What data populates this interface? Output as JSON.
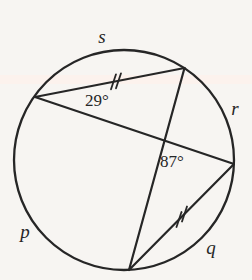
{
  "figure": {
    "type": "circle-geometry-diagram",
    "colors": {
      "background": "#f7f5f2",
      "stroke": "#262626",
      "scan_band": "#fdf1ec"
    },
    "labels": {
      "arc_top": "s",
      "arc_right": "r",
      "arc_left": "p",
      "arc_bottom_right": "q",
      "angle_at_left_vertex": "29°",
      "angle_at_intersection": "87°"
    },
    "marks": {
      "congruent_chords": "double tick marks on top chord and bottom-right chord"
    }
  }
}
